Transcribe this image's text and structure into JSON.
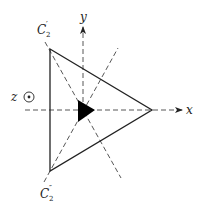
{
  "diagram": {
    "type": "symmetry-diagram",
    "axes": {
      "x_label": "x",
      "y_label": "y",
      "z_label": "z"
    },
    "twofold_axes": {
      "c2_prime": {
        "base": "C",
        "sub": "2",
        "sup": "′"
      },
      "c2_double_prime": {
        "base": "C",
        "sub": "2",
        "sup": "″"
      }
    },
    "colors": {
      "line": "#222222",
      "dash": "#444444",
      "fill": "#000000",
      "background": "#ffffff"
    }
  }
}
